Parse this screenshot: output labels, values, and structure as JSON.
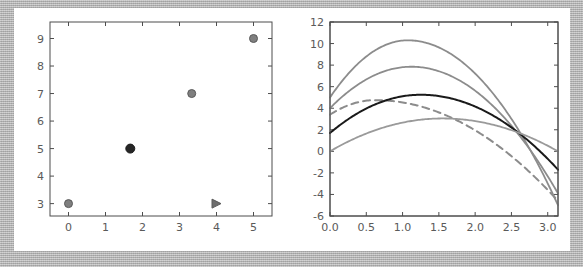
{
  "figure": {
    "background": "#ffffff",
    "frame_color": "#b0b0b0",
    "panel_count": 2
  },
  "chart_data": [
    {
      "type": "scatter",
      "panel": "left",
      "title": "",
      "xlabel": "",
      "ylabel": "",
      "xlim": [
        -0.5,
        5.5
      ],
      "ylim": [
        2.55,
        9.6
      ],
      "xticks": [
        0,
        1,
        2,
        3,
        4,
        5
      ],
      "xtick_labels": [
        "0",
        "1",
        "2",
        "3",
        "4",
        "5"
      ],
      "yticks": [
        3,
        4,
        5,
        6,
        7,
        8,
        9
      ],
      "ytick_labels": [
        "3",
        "4",
        "5",
        "6",
        "7",
        "8",
        "9"
      ],
      "grid": false,
      "legend": "none",
      "series": [
        {
          "name": "gray-circles",
          "marker": "circle",
          "color": "#7f7f7f",
          "edge_color": "#5a5a5a",
          "size": 8,
          "points": [
            {
              "x": 0,
              "y": 3
            },
            {
              "x": 3.33,
              "y": 7
            },
            {
              "x": 5,
              "y": 9
            }
          ]
        },
        {
          "name": "black-circle",
          "marker": "circle",
          "color": "#262626",
          "edge_color": "#1a1a1a",
          "size": 9,
          "points": [
            {
              "x": 1.67,
              "y": 5
            }
          ]
        },
        {
          "name": "gray-triangle",
          "marker": "triangle-right",
          "color": "#6e6e6e",
          "edge_color": "#5a5a5a",
          "size": 8,
          "points": [
            {
              "x": 4,
              "y": 3
            }
          ]
        }
      ]
    },
    {
      "type": "line",
      "panel": "right",
      "title": "",
      "xlabel": "",
      "ylabel": "",
      "xlim": [
        0.0,
        3.1416
      ],
      "ylim": [
        -6,
        12
      ],
      "xticks": [
        0.0,
        0.5,
        1.0,
        1.5,
        2.0,
        2.5,
        3.0
      ],
      "xtick_labels": [
        "0.0",
        "0.5",
        "1.0",
        "1.5",
        "2.0",
        "2.5",
        "3.0"
      ],
      "yticks": [
        -6,
        -4,
        -2,
        0,
        2,
        4,
        6,
        8,
        10,
        12
      ],
      "ytick_labels": [
        "-6",
        "-4",
        "-2",
        "0",
        "2",
        "4",
        "6",
        "8",
        "10",
        "12"
      ],
      "grid": false,
      "legend": "none",
      "convergence_point": {
        "x": 2.45,
        "y": 1.5
      },
      "series": [
        {
          "name": "curve-top",
          "style": "solid",
          "color": "#8c8c8c",
          "width": 1.8,
          "y0": 5.0,
          "peak": {
            "x": 1.07,
            "y": 10.3
          },
          "y_end": -5.0
        },
        {
          "name": "curve-second",
          "style": "solid",
          "color": "#8c8c8c",
          "width": 1.8,
          "y0": 4.0,
          "peak": {
            "x": 1.12,
            "y": 7.85
          },
          "y_end": -3.9
        },
        {
          "name": "curve-dashed",
          "style": "dashed",
          "color": "#8c8c8c",
          "width": 2.0,
          "dash": "7,5",
          "y0": 3.4,
          "peak": {
            "x": 0.62,
            "y": 4.75
          },
          "y_end": -4.6
        },
        {
          "name": "curve-black",
          "style": "solid",
          "color": "#1a1a1a",
          "width": 2.0,
          "y0": 1.7,
          "peak": {
            "x": 1.25,
            "y": 5.25
          },
          "y_end": -1.7
        },
        {
          "name": "curve-bottom",
          "style": "solid",
          "color": "#9a9a9a",
          "width": 1.8,
          "y0": 0.0,
          "peak": {
            "x": 1.55,
            "y": 3.05
          },
          "y_end": 0.0
        }
      ]
    }
  ]
}
